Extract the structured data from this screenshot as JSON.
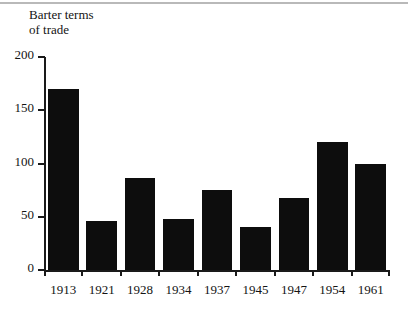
{
  "chart_data": {
    "type": "bar",
    "title": "Barter terms\nof trade",
    "xlabel": "",
    "ylabel": "",
    "categories": [
      "1913",
      "1921",
      "1928",
      "1934",
      "1937",
      "1945",
      "1947",
      "1954",
      "1961"
    ],
    "values": [
      170,
      46,
      86,
      48,
      75,
      40,
      68,
      120,
      100
    ],
    "ylim": [
      0,
      200
    ],
    "yticks": [
      0,
      50,
      100,
      150,
      200
    ],
    "ytick_labels": [
      "0",
      "50",
      "100",
      "150",
      "200"
    ],
    "grid": false,
    "legend": null,
    "bar_color": "#0d0d0d",
    "axis_color": "#1a1a1a",
    "background_color": "#ffffff"
  }
}
